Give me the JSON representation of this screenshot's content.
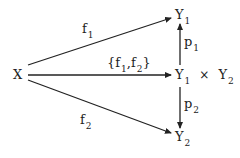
{
  "diagram": {
    "type": "commutative-diagram",
    "nodes": [
      {
        "id": "X",
        "label": "X",
        "sub": ""
      },
      {
        "id": "Y1",
        "label": "Y",
        "sub": "1"
      },
      {
        "id": "Y1xY2",
        "label": "Y",
        "sub": "1",
        "op": "×",
        "label2": "Y",
        "sub2": "2"
      },
      {
        "id": "Y2",
        "label": "Y",
        "sub": "2"
      }
    ],
    "edges": [
      {
        "from": "X",
        "to": "Y1",
        "label": "f",
        "sub": "1"
      },
      {
        "from": "X",
        "to": "Y1xY2",
        "label_open": "{f",
        "sub1": "1",
        "mid": ",f",
        "sub2": "2",
        "label_close": "}"
      },
      {
        "from": "X",
        "to": "Y2",
        "label": "f",
        "sub": "2"
      },
      {
        "from": "Y1xY2",
        "to": "Y1",
        "label": "p",
        "sub": "1"
      },
      {
        "from": "Y1xY2",
        "to": "Y2",
        "label": "p",
        "sub": "2"
      }
    ],
    "colors": {
      "line": "#222222",
      "text": "#222222",
      "background": "#ffffff"
    }
  }
}
